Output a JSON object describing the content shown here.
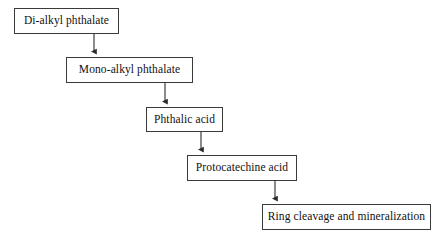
{
  "diagram": {
    "type": "flowchart",
    "orientation": "top-down-staircase",
    "background_color": "#ffffff",
    "border_color": "#3a3a3a",
    "text_color": "#111111",
    "arrow_color": "#2b2b2b",
    "nodes": [
      {
        "id": "node-0",
        "label": "Di-alkyl phthalate",
        "x": 14,
        "y": 8,
        "width": 105,
        "height": 26
      },
      {
        "id": "node-1",
        "label": "Mono-alkyl phthalate",
        "x": 66,
        "y": 57,
        "width": 127,
        "height": 26
      },
      {
        "id": "node-2",
        "label": "Phthalic acid",
        "x": 146,
        "y": 107,
        "width": 77,
        "height": 25
      },
      {
        "id": "node-3",
        "label": "Protocatechine acid",
        "x": 187,
        "y": 155,
        "width": 110,
        "height": 26
      },
      {
        "id": "node-4",
        "label": "Ring cleavage and mineralization",
        "x": 262,
        "y": 204,
        "width": 169,
        "height": 26
      }
    ],
    "edges": [
      {
        "id": "edge-0",
        "from": "node-0",
        "to": "node-1",
        "x": 94,
        "y1": 34,
        "y2": 57,
        "arrowhead": "filled-triangle"
      },
      {
        "id": "edge-1",
        "from": "node-1",
        "to": "node-2",
        "x": 165,
        "y1": 83,
        "y2": 107,
        "arrowhead": "filled-triangle"
      },
      {
        "id": "edge-2",
        "from": "node-2",
        "to": "node-3",
        "x": 201,
        "y1": 132,
        "y2": 155,
        "arrowhead": "filled-triangle"
      },
      {
        "id": "edge-3",
        "from": "node-3",
        "to": "node-4",
        "x": 275,
        "y1": 181,
        "y2": 204,
        "arrowhead": "filled-triangle"
      }
    ]
  }
}
